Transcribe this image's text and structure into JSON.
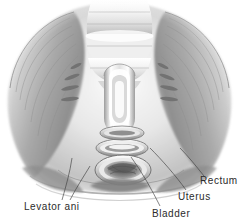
{
  "figure": {
    "kind": "anatomical-illustration",
    "style": "grayscale pencil/airbrush medical drawing",
    "background_color": "#ffffff",
    "ink_color": "#2b2b2b",
    "leader_line_color": "#4a4a4a",
    "width": 239,
    "height": 220
  },
  "labels": {
    "levator_ani": "Levator ani",
    "bladder": "Bladder",
    "uterus": "Uterus",
    "rectum": "Rectum"
  },
  "label_positions": [
    {
      "name": "levator-ani",
      "x": 24,
      "y": 202,
      "clipped": false
    },
    {
      "name": "bladder",
      "x": 152,
      "y": 209,
      "clipped": false
    },
    {
      "name": "uterus",
      "x": 178,
      "y": 192,
      "clipped": false
    },
    {
      "name": "rectum",
      "x": 200,
      "y": 176,
      "clipped": true
    }
  ],
  "structures": [
    {
      "name": "sacral-promontory",
      "region": "top-center"
    },
    {
      "name": "levator-ani-muscle-left",
      "region": "left"
    },
    {
      "name": "levator-ani-muscle-right",
      "region": "right"
    },
    {
      "name": "uterus-opening",
      "region": "center-upper"
    },
    {
      "name": "bladder-opening",
      "region": "center-middle"
    },
    {
      "name": "rectum-opening",
      "region": "center-lower"
    },
    {
      "name": "pelvic-brim-left",
      "region": "left-outer"
    },
    {
      "name": "pelvic-brim-right",
      "region": "right-outer"
    }
  ]
}
